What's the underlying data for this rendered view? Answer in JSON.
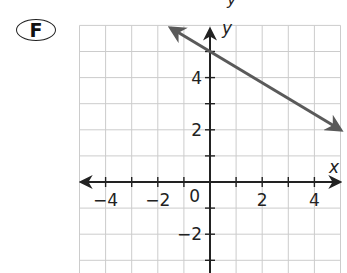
{
  "figure": {
    "label": "F",
    "top_clipped_text": "y"
  },
  "axes": {
    "x_label": "x",
    "y_label": "y",
    "origin_label": "0",
    "x_tick_labels": [
      "−4",
      "−2",
      "2",
      "4"
    ],
    "y_tick_labels": [
      "4",
      "2",
      "−2"
    ]
  },
  "colors": {
    "grid": "#cccccc",
    "axis": "#222222",
    "line": "#5a5a5a",
    "text": "#222222"
  },
  "chart_data": {
    "type": "line",
    "title": "",
    "xlabel": "x",
    "ylabel": "y",
    "xlim": [
      -5,
      5
    ],
    "ylim": [
      -3.5,
      6
    ],
    "grid": true,
    "x_ticks": [
      -4,
      -2,
      0,
      2,
      4
    ],
    "y_ticks": [
      -2,
      2,
      4
    ],
    "series": [
      {
        "name": "line",
        "equation": "y = -0.6x + 5",
        "x": [
          -1.5,
          0,
          5
        ],
        "y": [
          5.9,
          5,
          2
        ],
        "arrows_both_ends": true
      }
    ]
  }
}
